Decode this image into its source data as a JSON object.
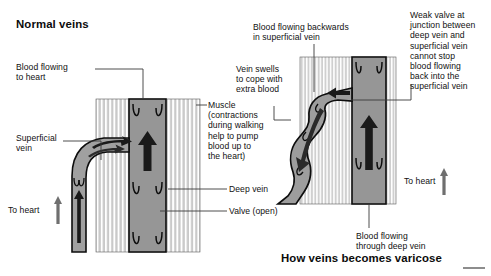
{
  "figure": {
    "domain": "medical-illustration",
    "left_panel_title": "Normal veins",
    "right_panel_title": "How veins becomes varicose"
  },
  "colors": {
    "ink": "#111111",
    "muscle_fill": "#c9c9c9",
    "muscle_stripe": "#ffffff",
    "vein_lumen": "#969696",
    "vein_lumen_light": "#a8a8a8",
    "arrow_dark": "#1a1a1a",
    "arrow_gray": "#6f6f6f",
    "outline": "#0d0d0d",
    "leader": "#3a3a3a",
    "background": "#ffffff"
  },
  "left_panel": {
    "labels": [
      {
        "id": "blood-flowing-to-heart",
        "text": "Blood flowing\nto heart"
      },
      {
        "id": "superficial-vein",
        "text": "Superficial\nvein"
      },
      {
        "id": "to-heart",
        "text": "To heart"
      },
      {
        "id": "muscle",
        "text": "Muscle\n(contractions\nduring walking\nhelp to pump\nblood up to\nthe heart)"
      },
      {
        "id": "deep-vein",
        "text": "Deep vein"
      },
      {
        "id": "valve-open",
        "text": "Valve (open)"
      }
    ],
    "arrows": [
      {
        "id": "deep-vein-up-arrow",
        "direction": "up",
        "meaning": "blood pumped up deep vein"
      },
      {
        "id": "superficial-inflow-arrow",
        "direction": "up-right",
        "meaning": "blood entering deep vein"
      },
      {
        "id": "to-heart-arrow",
        "direction": "up",
        "meaning": "flow toward heart"
      },
      {
        "id": "superficial-up-arrow",
        "direction": "up",
        "meaning": "superficial vein flow"
      }
    ]
  },
  "right_panel": {
    "labels": [
      {
        "id": "blood-backwards",
        "text": "Blood flowing backwards\nin superficial vein"
      },
      {
        "id": "vein-swells",
        "text": "Vein swells\nto cope with\nextra blood"
      },
      {
        "id": "weak-valve",
        "text": "Weak valve at\njunction between\ndeep vein and\nsuperficial vein\ncannot stop\nblood flowing\nback into the\nsuperficial vein"
      },
      {
        "id": "to-heart",
        "text": "To heart"
      },
      {
        "id": "blood-through-deep-vein",
        "text": "Blood flowing\nthrough deep vein"
      }
    ],
    "arrows": [
      {
        "id": "backflow-arrow-upper",
        "direction": "left",
        "meaning": "blood flowing back out of deep vein"
      },
      {
        "id": "backflow-arrow-lower",
        "direction": "down",
        "meaning": "backward flow down swollen vein"
      },
      {
        "id": "deep-vein-up-arrow",
        "direction": "up",
        "meaning": "blood flowing up deep vein"
      },
      {
        "id": "to-heart-arrow",
        "direction": "up",
        "meaning": "flow toward heart"
      }
    ]
  }
}
